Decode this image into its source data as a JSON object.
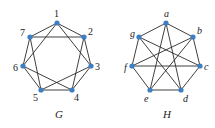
{
  "colors": {
    "vertex": "#3d7fc4",
    "edge": "#2a2a2a",
    "background": "#ffffff"
  },
  "graphs": [
    {
      "name": "G",
      "label": "G",
      "label_pos": [
        55,
        118
      ],
      "italic_vertices": false,
      "vertices": [
        {
          "id": "1",
          "label": "1",
          "x": 57,
          "y": 23,
          "lx": 54,
          "ly": 17
        },
        {
          "id": "2",
          "label": "2",
          "x": 84,
          "y": 37,
          "lx": 88,
          "ly": 35
        },
        {
          "id": "3",
          "label": "3",
          "x": 91,
          "y": 66,
          "lx": 95,
          "ly": 70
        },
        {
          "id": "4",
          "label": "4",
          "x": 72,
          "y": 90,
          "lx": 74,
          "ly": 101
        },
        {
          "id": "5",
          "label": "5",
          "x": 41,
          "y": 90,
          "lx": 33,
          "ly": 101
        },
        {
          "id": "6",
          "label": "6",
          "x": 23,
          "y": 66,
          "lx": 13,
          "ly": 71
        },
        {
          "id": "7",
          "label": "7",
          "x": 30,
          "y": 37,
          "lx": 20,
          "ly": 36
        }
      ],
      "edges": [
        [
          "1",
          "2"
        ],
        [
          "2",
          "3"
        ],
        [
          "3",
          "4"
        ],
        [
          "4",
          "5"
        ],
        [
          "5",
          "6"
        ],
        [
          "6",
          "7"
        ],
        [
          "7",
          "1"
        ],
        [
          "1",
          "3"
        ],
        [
          "2",
          "4"
        ],
        [
          "3",
          "5"
        ],
        [
          "4",
          "6"
        ],
        [
          "5",
          "7"
        ],
        [
          "6",
          "1"
        ],
        [
          "7",
          "2"
        ]
      ]
    },
    {
      "name": "H",
      "label": "H",
      "label_pos": [
        163,
        118
      ],
      "italic_vertices": true,
      "vertices": [
        {
          "id": "a",
          "label": "a",
          "x": 166,
          "y": 23,
          "lx": 164,
          "ly": 17
        },
        {
          "id": "b",
          "label": "b",
          "x": 193,
          "y": 37,
          "lx": 197,
          "ly": 34
        },
        {
          "id": "c",
          "label": "c",
          "x": 200,
          "y": 66,
          "lx": 204,
          "ly": 70
        },
        {
          "id": "d",
          "label": "d",
          "x": 181,
          "y": 90,
          "lx": 183,
          "ly": 102
        },
        {
          "id": "e",
          "label": "e",
          "x": 150,
          "y": 90,
          "lx": 144,
          "ly": 102
        },
        {
          "id": "f",
          "label": "f",
          "x": 132,
          "y": 66,
          "lx": 124,
          "ly": 71
        },
        {
          "id": "g",
          "label": "g",
          "x": 139,
          "y": 37,
          "lx": 130,
          "ly": 37
        }
      ],
      "edges": [
        [
          "a",
          "b"
        ],
        [
          "a",
          "g"
        ],
        [
          "a",
          "e"
        ],
        [
          "a",
          "d"
        ],
        [
          "b",
          "c"
        ],
        [
          "b",
          "f"
        ],
        [
          "b",
          "e"
        ],
        [
          "c",
          "g"
        ],
        [
          "c",
          "f"
        ],
        [
          "c",
          "d"
        ],
        [
          "d",
          "e"
        ],
        [
          "d",
          "g"
        ],
        [
          "e",
          "f"
        ],
        [
          "f",
          "g"
        ]
      ]
    }
  ]
}
